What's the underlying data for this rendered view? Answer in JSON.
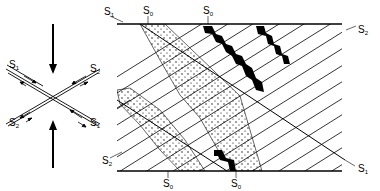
{
  "figure": {
    "type": "geological structure diagram",
    "stress_diagram": {
      "arrows": [
        "compression-top",
        "compression-bottom"
      ],
      "shear_planes": [
        {
          "label_main": "S",
          "label_sub": "1",
          "position": "upper-left"
        },
        {
          "label_main": "S",
          "label_sub": "2",
          "position": "upper-right"
        },
        {
          "label_main": "S",
          "label_sub": "2",
          "position": "lower-left"
        },
        {
          "label_main": "S",
          "label_sub": "1",
          "position": "lower-right"
        }
      ]
    },
    "block_diagram": {
      "labels": {
        "s1_top_left": {
          "main": "S",
          "sub": "1"
        },
        "s0_top_a": {
          "main": "S",
          "sub": "0"
        },
        "s0_top_b": {
          "main": "S",
          "sub": "0"
        },
        "s2_right": {
          "main": "S",
          "sub": "2"
        },
        "s2_left": {
          "main": "S",
          "sub": "2"
        },
        "s1_bottom_right": {
          "main": "S",
          "sub": "1"
        },
        "s0_bottom_a": {
          "main": "S",
          "sub": "0"
        },
        "s0_bottom_b": {
          "main": "S",
          "sub": "0"
        }
      },
      "bands": [
        "dotted-layer-a",
        "dotted-layer-b",
        "black-layer-a",
        "black-layer-b"
      ]
    },
    "colors": {
      "ink": "#000000",
      "paper": "#ffffff"
    }
  }
}
